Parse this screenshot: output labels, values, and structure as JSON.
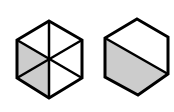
{
  "figures": [
    {
      "name": "hexagon-six-triangles",
      "description": "Hexagon divided into 6 triangles by 3 diagonals; 2 adjacent lower-left triangles shaded",
      "shaded_fraction": "2/6"
    },
    {
      "name": "hexagon-halved",
      "description": "Hexagon split by one diagonal; lower-left half shaded",
      "shaded_fraction": "1/2"
    }
  ],
  "colors": {
    "stroke": "#000000",
    "shade": "#cccccc",
    "background": "#ffffff"
  }
}
